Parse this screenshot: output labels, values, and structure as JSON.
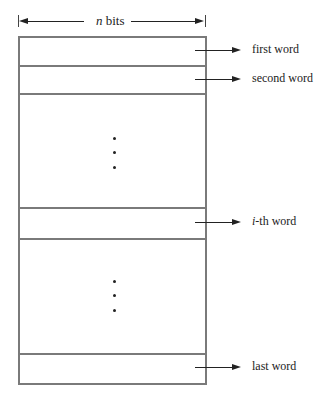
{
  "header": {
    "width_label_var": "n",
    "width_label_unit": " bits"
  },
  "words": [
    {
      "label_prefix": "",
      "label_suffix": "first word"
    },
    {
      "label_prefix": "",
      "label_suffix": "second word"
    },
    {
      "label_prefix": "i",
      "label_suffix": "-th word"
    },
    {
      "label_prefix": "",
      "label_suffix": "last word"
    }
  ],
  "ellipsis": [
    "vertical-dots-1",
    "vertical-dots-2"
  ],
  "colors": {
    "box_border": "#7a7a7a",
    "arrow": "#222222"
  }
}
